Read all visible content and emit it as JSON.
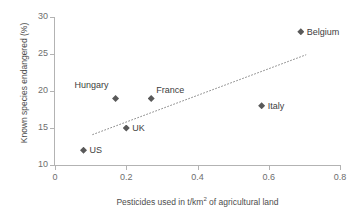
{
  "chart_data": {
    "type": "scatter",
    "title": "",
    "xlabel": "Pesticides used in t/km² of agricultural land",
    "ylabel": "Known species endangered (%)",
    "xlim": [
      0,
      0.8
    ],
    "ylim": [
      10,
      30
    ],
    "xticks": [
      "0",
      "0.2",
      "0.4",
      "0.6",
      "0.8"
    ],
    "xtick_values": [
      0,
      0.2,
      0.4,
      0.6,
      0.8
    ],
    "yticks": [
      "10",
      "15",
      "20",
      "25",
      "30"
    ],
    "ytick_values": [
      10,
      15,
      20,
      25,
      30
    ],
    "grid": false,
    "legend": false,
    "marker_color": "#595959",
    "axis_color": "#b3b3b3",
    "points": [
      {
        "label": "US",
        "x": 0.08,
        "y": 12,
        "label_pos": "right"
      },
      {
        "label": "Hungary",
        "x": 0.17,
        "y": 19,
        "label_pos": "above-left"
      },
      {
        "label": "UK",
        "x": 0.2,
        "y": 15,
        "label_pos": "right"
      },
      {
        "label": "France",
        "x": 0.27,
        "y": 19,
        "label_pos": "right-above"
      },
      {
        "label": "Italy",
        "x": 0.58,
        "y": 18,
        "label_pos": "right"
      },
      {
        "label": "Belgium",
        "x": 0.69,
        "y": 28,
        "label_pos": "right"
      }
    ],
    "trendline": {
      "style": "dotted",
      "color": "#808080",
      "x_start": 0.105,
      "y_start": 14.1,
      "x_end": 0.705,
      "y_end": 24.9
    },
    "xaxis_label_parts": {
      "before": "Pesticides used in t/km",
      "superscript": "2",
      "after": " of agricultural land"
    }
  }
}
